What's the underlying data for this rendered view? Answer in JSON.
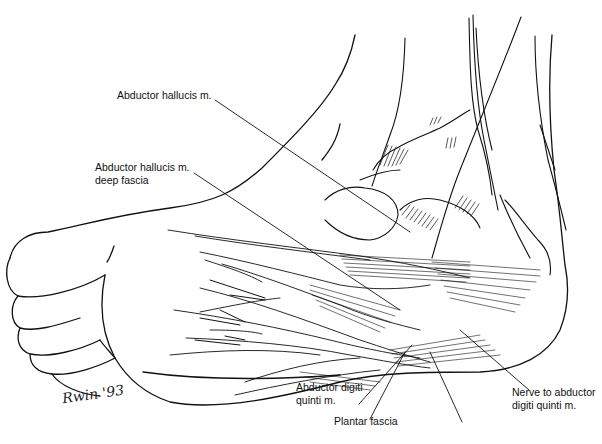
{
  "figure": {
    "line_color": "#111111",
    "background": "#ffffff",
    "labels": [
      {
        "id": "abductor-hallucis",
        "text": "Abductor hallucis m.",
        "x": 117,
        "y": 96
      },
      {
        "id": "abductor-hallucis-deep-fascia-line1",
        "text": "Abductor hallucis m.",
        "x": 95,
        "y": 168
      },
      {
        "id": "abductor-hallucis-deep-fascia-line2",
        "text": "deep fascia",
        "x": 95,
        "y": 181
      },
      {
        "id": "abductor-digiti-quinti-line1",
        "text": "Abductor digiti",
        "x": 296,
        "y": 388
      },
      {
        "id": "abductor-digiti-quinti-line2",
        "text": "quinti m.",
        "x": 296,
        "y": 401
      },
      {
        "id": "plantar-fascia",
        "text": "Plantar fascia",
        "x": 334,
        "y": 422
      },
      {
        "id": "nerve-to-abductor-line1",
        "text": "Nerve to abductor",
        "x": 512,
        "y": 393
      },
      {
        "id": "nerve-to-abductor-line2",
        "text": "digiti quinti m.",
        "x": 512,
        "y": 406
      }
    ],
    "signature": "Rwin '93"
  }
}
